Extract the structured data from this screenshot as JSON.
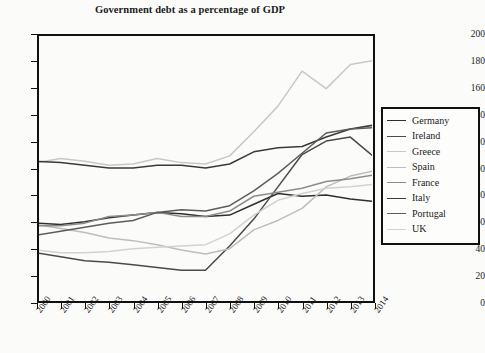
{
  "chart_data": {
    "type": "line",
    "title": "Government debt as a percentage of GDP",
    "xlabel": "",
    "ylabel": "",
    "ylim": [
      0,
      200
    ],
    "ytick_step": 20,
    "yticks": [
      200,
      180,
      160,
      140,
      120,
      100,
      80,
      60,
      40,
      20,
      0
    ],
    "grid": false,
    "legend_position": "right",
    "categories": [
      "2000",
      "2001",
      "2002",
      "2003",
      "2004",
      "2005",
      "2006",
      "2007",
      "2008",
      "2009",
      "2010",
      "2011",
      "2012",
      "2013",
      "2014"
    ],
    "series": [
      {
        "name": "Germany",
        "color": "#2f2f2f",
        "values": [
          59,
          58,
          60,
          63,
          65,
          67,
          66,
          64,
          65,
          73,
          81,
          79,
          80,
          77,
          75
        ]
      },
      {
        "name": "Ireland",
        "color": "#4a4a4a",
        "values": [
          37,
          34,
          31,
          30,
          28,
          26,
          24,
          24,
          42,
          62,
          86,
          110,
          120,
          123,
          108
        ]
      },
      {
        "name": "Greece",
        "color": "#c8c8c8",
        "values": [
          104,
          107,
          105,
          102,
          103,
          107,
          104,
          103,
          109,
          127,
          146,
          172,
          159,
          177,
          180
        ]
      },
      {
        "name": "Spain",
        "color": "#bdbdbd",
        "values": [
          58,
          55,
          52,
          48,
          46,
          43,
          39,
          36,
          40,
          54,
          61,
          70,
          86,
          94,
          98
        ]
      },
      {
        "name": "France",
        "color": "#8c8c8c",
        "values": [
          57,
          57,
          59,
          64,
          65,
          67,
          64,
          64,
          68,
          79,
          82,
          85,
          90,
          92,
          95
        ]
      },
      {
        "name": "Italy",
        "color": "#3a3a3a",
        "values": [
          105,
          104,
          102,
          100,
          100,
          102,
          102,
          100,
          103,
          112,
          115,
          116,
          123,
          129,
          132
        ]
      },
      {
        "name": "Portugal",
        "color": "#5c5c5c",
        "values": [
          50,
          53,
          56,
          59,
          61,
          67,
          69,
          68,
          72,
          83,
          96,
          111,
          126,
          129,
          130
        ]
      },
      {
        "name": "UK",
        "color": "#d2d2d2",
        "values": [
          39,
          37,
          37,
          38,
          40,
          41,
          42,
          43,
          51,
          65,
          76,
          81,
          85,
          86,
          88
        ]
      }
    ]
  }
}
